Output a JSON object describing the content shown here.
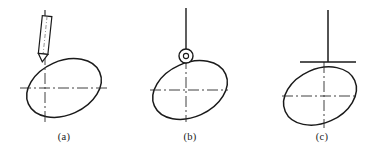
{
  "diagram": {
    "type": "engineering-line-drawing",
    "background_color": "#ffffff",
    "outline_color": "#1a1a1a",
    "centerline_color": "#2b2b2b",
    "figures": [
      {
        "id": "a",
        "caption": "(a)",
        "follower_type": "knife-edge-follower",
        "cam_shape": "tilted-oval-cam",
        "cam": {
          "cx": 64,
          "cy": 88,
          "rx": 39,
          "ry": 27,
          "rotation_deg": -24
        },
        "centerline_horizontal": {
          "x1": 20,
          "y1": 88,
          "x2": 108,
          "y2": 88
        },
        "centerline_vertical": {
          "x1": 64,
          "y1": 54,
          "x2": 64,
          "y2": 122
        },
        "follower_stem": {
          "x1": 45,
          "y1": 10,
          "x2": 45,
          "y2": 62
        },
        "follower_body": {
          "x": 39,
          "y": 16,
          "width": 12,
          "height": 38
        },
        "caption_position": {
          "x": 64,
          "y": 140
        }
      },
      {
        "id": "b",
        "caption": "(b)",
        "follower_type": "roller-follower",
        "cam_shape": "tilted-oval-cam",
        "cam": {
          "cx": 190,
          "cy": 90,
          "rx": 39,
          "ry": 27,
          "rotation_deg": -24
        },
        "centerline_horizontal": {
          "x1": 150,
          "y1": 90,
          "x2": 228,
          "y2": 90
        },
        "centerline_vertical": {
          "x1": 186,
          "y1": 58,
          "x2": 186,
          "y2": 122
        },
        "follower_stem": {
          "x1": 186,
          "y1": 8,
          "x2": 186,
          "y2": 52
        },
        "roller": {
          "cx": 186,
          "cy": 56,
          "r": 7,
          "hub_r": 2.5
        },
        "caption_position": {
          "x": 190,
          "y": 140
        }
      },
      {
        "id": "c",
        "caption": "(c)",
        "follower_type": "flat-faced-follower",
        "cam_shape": "tilted-oval-cam",
        "cam": {
          "cx": 320,
          "cy": 96,
          "rx": 38,
          "ry": 27,
          "rotation_deg": -24
        },
        "centerline_horizontal": {
          "x1": 282,
          "y1": 96,
          "x2": 358,
          "y2": 96
        },
        "centerline_vertical": {
          "x1": 324,
          "y1": 62,
          "x2": 324,
          "y2": 128
        },
        "follower_stem": {
          "x1": 328,
          "y1": 10,
          "x2": 328,
          "y2": 62
        },
        "flat_face": {
          "x1": 300,
          "y1": 62,
          "x2": 356,
          "y2": 62
        },
        "caption_position": {
          "x": 322,
          "y": 140
        }
      }
    ]
  }
}
